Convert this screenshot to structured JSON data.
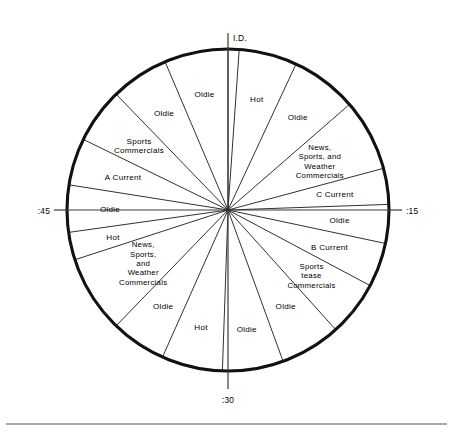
{
  "figure": {
    "type": "radio-format-clock",
    "center_x": 228,
    "center_y": 210,
    "radius": 161,
    "accent_color": "#111111",
    "background_color": "#ffffff"
  },
  "clock_marks": [
    {
      "name": "mark-top",
      "label": "I.D.",
      "angle_deg": 0
    },
    {
      "name": "mark-right",
      "label": ":15",
      "angle_deg": 90
    },
    {
      "name": "mark-bottom",
      "label": ":30",
      "angle_deg": 180
    },
    {
      "name": "mark-left",
      "label": ":45",
      "angle_deg": 270
    }
  ],
  "chart_data": {
    "type": "pie",
    "title": "",
    "xlabel": "",
    "ylabel": "",
    "legend": [],
    "categories": [
      "I.D.",
      "Hot",
      "Oldie",
      "News, Sports, and Weather Commercials",
      "C Current",
      "Oldie",
      "B Current",
      "Sports tease Commercials",
      "Oldie",
      "Oldie",
      "Hot",
      "Oldie",
      "News, Sports, and Weather Commercials",
      "Hot",
      "Oldie",
      "A Current",
      "Sports Commercials",
      "Oldie",
      "Oldie"
    ],
    "values": [
      4,
      21,
      24,
      26,
      13,
      14,
      16,
      20,
      22,
      22,
      22,
      20,
      28,
      22,
      17,
      23,
      23,
      22,
      21
    ],
    "units": "degrees"
  },
  "segments": [
    {
      "id": "id-sliver",
      "name": "segment-id",
      "label": "I.D.",
      "label_lines": [],
      "start_deg": 0,
      "end_deg": 4,
      "label_radius": 0,
      "show_label": false
    },
    {
      "id": "hot-1",
      "name": "segment-hot-1",
      "label": "Hot",
      "label_lines": [
        "Hot"
      ],
      "start_deg": 4,
      "end_deg": 25,
      "label_radius": 115,
      "show_label": true
    },
    {
      "id": "oldie-1",
      "name": "segment-oldie-1",
      "label": "Oldie",
      "label_lines": [
        "Oldie"
      ],
      "start_deg": 25,
      "end_deg": 49,
      "label_radius": 116,
      "show_label": true
    },
    {
      "id": "nswc-1",
      "name": "segment-news-sports-weather-commercials-1",
      "label": "News, Sports, and Weather Commercials",
      "label_lines": [
        "News,",
        "Sports, and",
        "Weather",
        "Commercials"
      ],
      "start_deg": 49,
      "end_deg": 75,
      "label_radius": 104,
      "show_label": true
    },
    {
      "id": "c-current",
      "name": "segment-c-current",
      "label": "C Current",
      "label_lines": [
        "C Current"
      ],
      "start_deg": 75,
      "end_deg": 88,
      "label_radius": 108,
      "show_label": true
    },
    {
      "id": "oldie-2",
      "name": "segment-oldie-2",
      "label": "Oldie",
      "label_lines": [
        "Oldie"
      ],
      "start_deg": 88,
      "end_deg": 102,
      "label_radius": 112,
      "show_label": true
    },
    {
      "id": "b-current",
      "name": "segment-b-current",
      "label": "B Current",
      "label_lines": [
        "B Current"
      ],
      "start_deg": 102,
      "end_deg": 118,
      "label_radius": 108,
      "show_label": true
    },
    {
      "id": "sports-tease",
      "name": "segment-sports-tease-commercials",
      "label": "Sports tease Commercials",
      "label_lines": [
        "Sports",
        "tease",
        "Commercials"
      ],
      "start_deg": 118,
      "end_deg": 138,
      "label_radius": 106,
      "show_label": true
    },
    {
      "id": "oldie-3",
      "name": "segment-oldie-3",
      "label": "Oldie",
      "label_lines": [
        "Oldie"
      ],
      "start_deg": 138,
      "end_deg": 160,
      "label_radius": 112,
      "show_label": true
    },
    {
      "id": "oldie-4",
      "name": "segment-oldie-4",
      "label": "Oldie",
      "label_lines": [
        "Oldie"
      ],
      "start_deg": 160,
      "end_deg": 182,
      "label_radius": 120,
      "show_label": true
    },
    {
      "id": "hot-2",
      "name": "segment-hot-2",
      "label": "Hot",
      "label_lines": [
        "Hot"
      ],
      "start_deg": 182,
      "end_deg": 204,
      "label_radius": 120,
      "show_label": true
    },
    {
      "id": "oldie-5",
      "name": "segment-oldie-5",
      "label": "Oldie",
      "label_lines": [
        "Oldie"
      ],
      "start_deg": 204,
      "end_deg": 224,
      "label_radius": 116,
      "show_label": true
    },
    {
      "id": "nswc-2",
      "name": "segment-news-sports-weather-commercials-2",
      "label": "News, Sports, and Weather Commercials",
      "label_lines": [
        "News,",
        "Sports,",
        "and",
        "Weather",
        "Commercials"
      ],
      "start_deg": 224,
      "end_deg": 252,
      "label_radius": 100,
      "show_label": true
    },
    {
      "id": "hot-3",
      "name": "segment-hot-3",
      "label": "Hot",
      "label_lines": [
        "Hot"
      ],
      "start_deg": 252,
      "end_deg": 262,
      "label_radius": 118,
      "show_label": true
    },
    {
      "id": "oldie-6",
      "name": "segment-oldie-6",
      "label": "Oldie",
      "label_lines": [
        "Oldie"
      ],
      "start_deg": 262,
      "end_deg": 279,
      "label_radius": 118,
      "show_label": true
    },
    {
      "id": "a-current",
      "name": "segment-a-current",
      "label": "A Current",
      "label_lines": [
        "A  Current"
      ],
      "start_deg": 279,
      "end_deg": 296,
      "label_radius": 110,
      "show_label": true
    },
    {
      "id": "sports-commercials",
      "name": "segment-sports-commercials",
      "label": "Sports Commercials",
      "label_lines": [
        "Sports",
        "Commercials"
      ],
      "start_deg": 296,
      "end_deg": 316,
      "label_radius": 110,
      "show_label": true
    },
    {
      "id": "oldie-7",
      "name": "segment-oldie-7",
      "label": "Oldie",
      "label_lines": [
        "Oldie"
      ],
      "start_deg": 316,
      "end_deg": 337,
      "label_radius": 116,
      "show_label": true
    },
    {
      "id": "oldie-8",
      "name": "segment-oldie-8",
      "label": "Oldie",
      "label_lines": [
        "Oldie"
      ],
      "start_deg": 337,
      "end_deg": 360,
      "label_radius": 118,
      "show_label": true
    }
  ]
}
